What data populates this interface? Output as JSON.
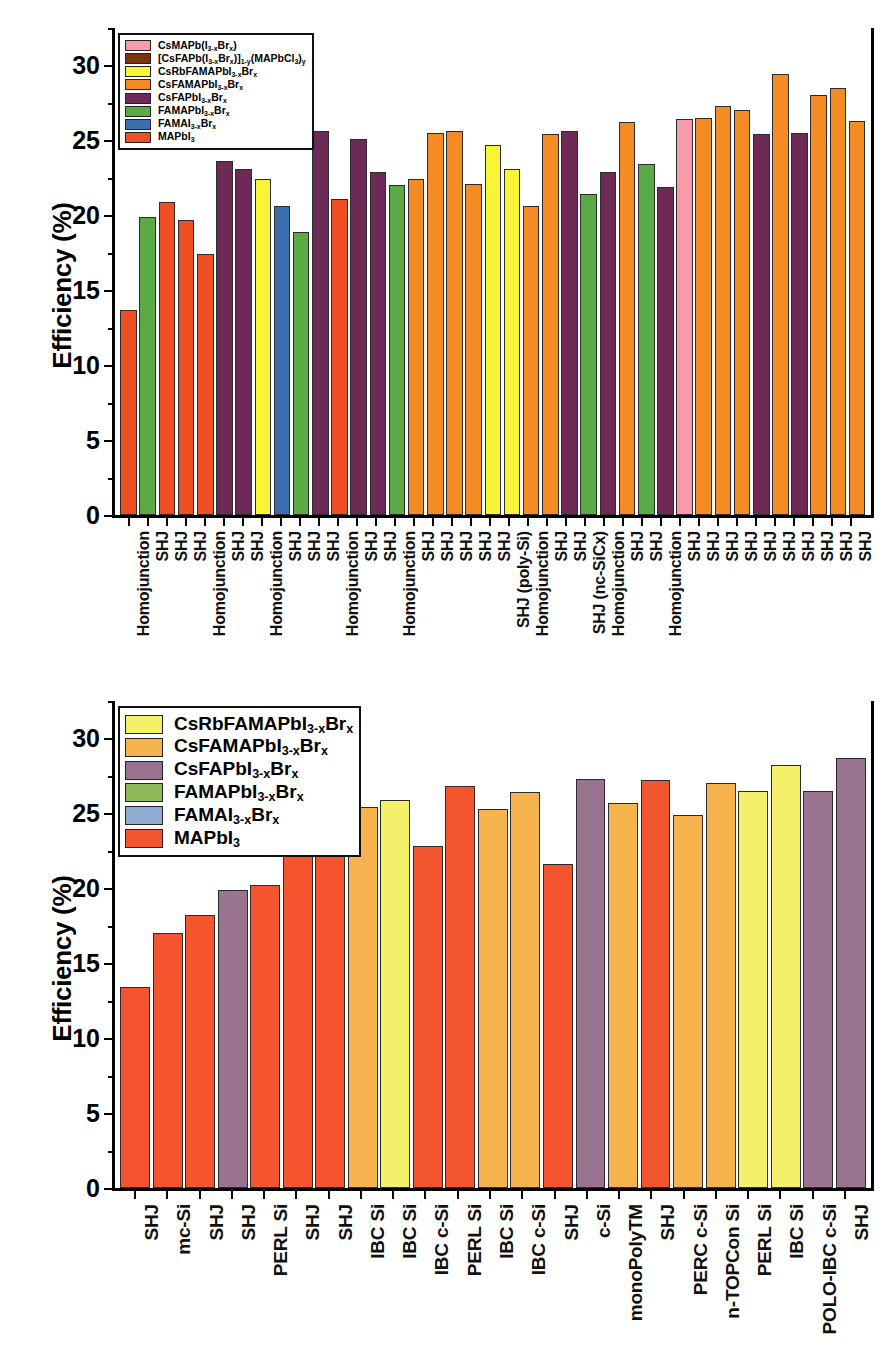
{
  "axis": {
    "ylabel": "Efficiency (%)",
    "yticks": [
      0,
      5,
      10,
      15,
      20,
      25,
      30
    ],
    "ymin": 0,
    "ymax": 32.5
  },
  "chart_data": [
    {
      "type": "bar",
      "panel": "top",
      "title": "",
      "xlabel": "",
      "ylabel": "Efficiency (%)",
      "ylim": [
        0,
        32.5
      ],
      "grid": false,
      "legend_position": "upper-left",
      "legend": [
        {
          "label": "CsMAPb(I3-xBrx)",
          "color": "#f79baa"
        },
        {
          "label": "[CsFAPb(I3-xBrx)]1-y(MAPbCl3)y",
          "color": "#7b3410"
        },
        {
          "label": "CsRbFAMAPbI3-xBrx",
          "color": "#f8f436"
        },
        {
          "label": "CsFAMAPbI3-xBrx",
          "color": "#f58b23"
        },
        {
          "label": "CsFAPbI3-xBrx",
          "color": "#6d2a56"
        },
        {
          "label": "FAMAPbI3-xBrx",
          "color": "#5aaa46"
        },
        {
          "label": "FAMAI3-xBrx",
          "color": "#3a6fb0"
        },
        {
          "label": "MAPbI3",
          "color": "#f04e23"
        }
      ],
      "categories": [
        "Homojunction",
        "SHJ",
        "SHJ",
        "SHJ",
        "Homojunction",
        "SHJ",
        "SHJ",
        "Homojunction",
        "SHJ",
        "SHJ",
        "SHJ",
        "Homojunction",
        "SHJ",
        "SHJ",
        "Homojunction",
        "SHJ",
        "SHJ",
        "SHJ",
        "SHJ",
        "SHJ",
        "SHJ (poly-Si)",
        "Homojunction",
        "SHJ",
        "SHJ",
        "SHJ (nc-SiCx)",
        "Homojunction",
        "SHJ",
        "SHJ",
        "Homojunction",
        "SHJ",
        "SHJ",
        "SHJ",
        "SHJ",
        "SHJ",
        "SHJ",
        "SHJ",
        "SHJ",
        "SHJ",
        "SHJ"
      ],
      "values": [
        13.7,
        19.9,
        20.9,
        19.7,
        17.4,
        23.6,
        23.1,
        22.4,
        20.6,
        18.9,
        25.6,
        21.1,
        25.1,
        22.9,
        22.0,
        22.4,
        25.5,
        25.6,
        22.1,
        24.7,
        23.1,
        20.6,
        25.4,
        25.6,
        21.4,
        22.9,
        26.2,
        23.4,
        21.9,
        26.4,
        26.5,
        27.3,
        27.0,
        25.4,
        29.4,
        25.5,
        28.0,
        28.5,
        26.3
      ],
      "colors": [
        "#f04e23",
        "#5aaa46",
        "#f04e23",
        "#f04e23",
        "#f04e23",
        "#6d2a56",
        "#6d2a56",
        "#f8f436",
        "#3a6fb0",
        "#5aaa46",
        "#6d2a56",
        "#f04e23",
        "#6d2a56",
        "#6d2a56",
        "#5aaa46",
        "#f58b23",
        "#f58b23",
        "#f58b23",
        "#f58b23",
        "#f8f436",
        "#f8f436",
        "#f58b23",
        "#f58b23",
        "#6d2a56",
        "#5aaa46",
        "#6d2a56",
        "#f58b23",
        "#5aaa46",
        "#6d2a56",
        "#f79baa",
        "#f58b23",
        "#f58b23",
        "#f58b23",
        "#6d2a56",
        "#f58b23",
        "#6d2a56",
        "#f58b23",
        "#f58b23",
        "#f58b23"
      ]
    },
    {
      "type": "bar",
      "panel": "bottom",
      "title": "",
      "xlabel": "",
      "ylabel": "Efficiency (%)",
      "ylim": [
        0,
        32.5
      ],
      "grid": false,
      "legend_position": "upper-left",
      "legend": [
        {
          "label": "CsRbFAMAPbI3-xBrx",
          "color": "#f4f06a"
        },
        {
          "label": "CsFAMAPbI3-xBrx",
          "color": "#f7b44e"
        },
        {
          "label": "CsFAPbI3-xBrx",
          "color": "#9a7391"
        },
        {
          "label": "FAMAPbI3-xBrx",
          "color": "#8fb85a"
        },
        {
          "label": "FAMAI3-xBrx",
          "color": "#8fadd4"
        },
        {
          "label": "MAPbI3",
          "color": "#f4552f"
        }
      ],
      "categories": [
        "SHJ",
        "mc-Si",
        "SHJ",
        "SHJ",
        "PERL Si",
        "SHJ",
        "SHJ",
        "IBC Si",
        "IBC Si",
        "IBC c-Si",
        "PERL Si",
        "IBC Si",
        "IBC c-Si",
        "SHJ",
        "c-Si",
        "monoPolyTM",
        "SHJ",
        "PERC c-Si",
        "n-TOPCon Si",
        "PERL Si",
        "IBC Si",
        "POLO-IBC c-Si",
        "SHJ"
      ],
      "values": [
        13.4,
        17.0,
        18.2,
        19.9,
        20.2,
        23.1,
        25.0,
        25.4,
        25.9,
        22.8,
        26.8,
        25.3,
        26.4,
        21.6,
        27.3,
        25.7,
        27.2,
        24.9,
        27.0,
        26.5,
        28.2,
        26.5,
        28.7
      ],
      "colors": [
        "#f4552f",
        "#f4552f",
        "#f4552f",
        "#9a7391",
        "#f4552f",
        "#f4552f",
        "#f4552f",
        "#f7b44e",
        "#f4f06a",
        "#f4552f",
        "#f4552f",
        "#f7b44e",
        "#f7b44e",
        "#f4552f",
        "#9a7391",
        "#f7b44e",
        "#f4552f",
        "#f7b44e",
        "#f7b44e",
        "#f4f06a",
        "#f4f06a",
        "#9a7391",
        "#9a7391"
      ]
    }
  ]
}
